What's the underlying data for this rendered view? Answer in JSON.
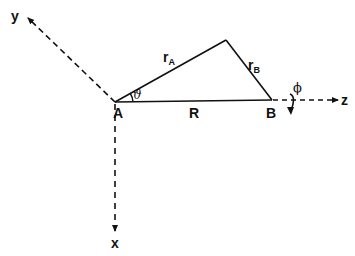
{
  "diagram": {
    "type": "coordinate-geometry",
    "colors": {
      "stroke": "#111111",
      "background": "#ffffff"
    },
    "points": {
      "A": {
        "label": "A"
      },
      "B": {
        "label": "B"
      }
    },
    "axes": {
      "x": {
        "label": "x",
        "style": "dashed",
        "direction": "down"
      },
      "y": {
        "label": "y",
        "style": "dashed",
        "direction": "up-left"
      },
      "z": {
        "label": "z",
        "style": "dashed",
        "direction": "right"
      }
    },
    "edges": {
      "rA": {
        "label": "r",
        "sub": "A"
      },
      "rB": {
        "label": "r",
        "sub": "B"
      },
      "R": {
        "label": "R"
      }
    },
    "angles": {
      "theta": {
        "label": "ϑ"
      },
      "phi": {
        "label": "ϕ"
      }
    }
  }
}
